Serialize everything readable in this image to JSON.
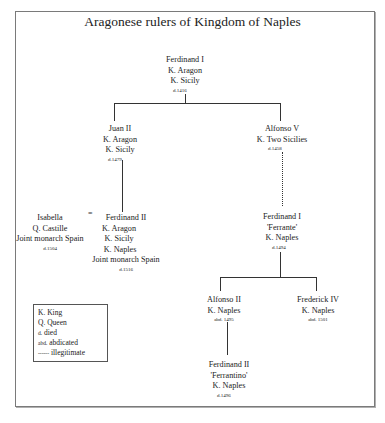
{
  "title": "Aragonese rulers of Kingdom of Naples",
  "nodes": {
    "ferdinand_i_aragon": {
      "name": "Ferdinand I",
      "titles": [
        "K. Aragon",
        "K. Sicily"
      ],
      "note": "d.1416"
    },
    "juan_ii": {
      "name": "Juan II",
      "titles": [
        "K. Aragon",
        "K. Sicily"
      ],
      "note": "d.1479"
    },
    "alfonso_v": {
      "name": "Alfonso V",
      "titles": [
        "K. Two Sicilies"
      ],
      "note": "d.1458"
    },
    "isabella": {
      "name": "Isabella",
      "titles": [
        "Q. Castille",
        "Joint monarch Spain"
      ],
      "note": "d.1504"
    },
    "ferdinand_ii_aragon": {
      "name": "Ferdinand II",
      "titles": [
        "K. Aragon",
        "K. Sicily",
        "K. Naples",
        "Joint monarch Spain"
      ],
      "note": "d.1516"
    },
    "ferdinand_i_ferrante": {
      "name": "Ferdinand I",
      "titles": [
        "'Ferrante'",
        "K. Naples"
      ],
      "note": "d.1494"
    },
    "alfonso_ii": {
      "name": "Alfonso II",
      "titles": [
        "K. Naples"
      ],
      "note": "abd. 1495"
    },
    "frederick_iv": {
      "name": "Frederick IV",
      "titles": [
        "K. Naples"
      ],
      "note": "abd. 1501"
    },
    "ferdinand_ii_ferrantino": {
      "name": "Ferdinand II",
      "titles": [
        "'Ferrantino'",
        "K. Naples"
      ],
      "note": "d.1496"
    }
  },
  "marriage_symbol": "=",
  "legend": {
    "items": [
      {
        "abbr": "K.",
        "meaning": "King"
      },
      {
        "abbr": "Q.",
        "meaning": "Queen"
      },
      {
        "abbr": "d.",
        "meaning": "died"
      },
      {
        "abbr": "abd.",
        "meaning": "abdicated"
      },
      {
        "abbr": "------",
        "meaning": "illegitimate"
      }
    ]
  }
}
